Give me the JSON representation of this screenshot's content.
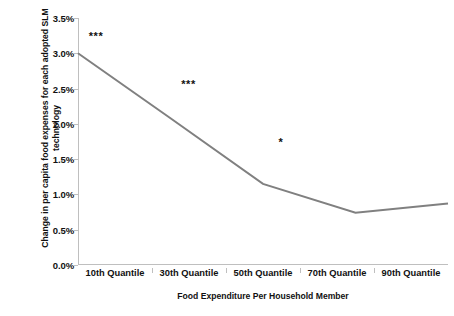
{
  "chart_data": {
    "type": "line",
    "title": "",
    "xlabel": "Food Expenditure Per Household Member",
    "ylabel": "Change in per capita food expenses for each adopted SLM technology",
    "categories": [
      "10th Quantile",
      "30th Quantile",
      "50th Quantile",
      "70th Quantile",
      "90th Quantile"
    ],
    "series": [
      {
        "name": "Change in per capita food expenses",
        "values": [
          3.0,
          2.08,
          1.15,
          0.74,
          0.87
        ],
        "color": "#808080"
      }
    ],
    "ylim": [
      0.0,
      3.5
    ],
    "ytick_values": [
      0.0,
      0.5,
      1.0,
      1.5,
      2.0,
      2.5,
      3.0,
      3.5
    ],
    "ytick_labels": [
      "0.0%",
      "0.5%",
      "1.0%",
      "1.5%",
      "2.0%",
      "2.5%",
      "3.0%",
      "3.5%"
    ],
    "grid": false,
    "legend": false,
    "markers": false,
    "annotations": [
      {
        "text": "***",
        "category_index": 0,
        "x_value": 0.0,
        "y_value": 3.24
      },
      {
        "text": "***",
        "category_index": 1,
        "x_value": 1.0,
        "y_value": 2.57
      },
      {
        "text": "*",
        "category_index": 2,
        "x_value": 2.0,
        "y_value": 1.74
      }
    ]
  },
  "axis": {
    "y_title_line1": "Change in per capita food expenses for each adopted SLM",
    "y_title_line2": "technology",
    "x_title": "Food Expenditure Per Household Member"
  },
  "colors": {
    "line": "#808080",
    "axis": "#bfbfbf",
    "text": "#111111",
    "background": "#ffffff"
  }
}
